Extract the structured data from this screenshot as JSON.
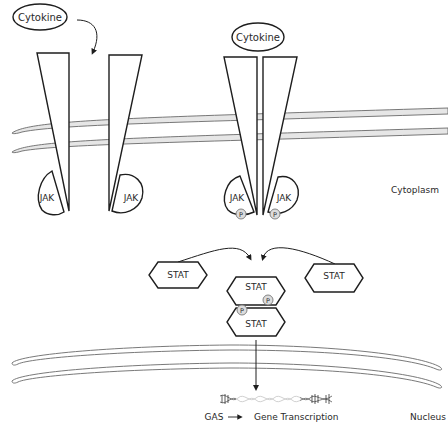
{
  "diagram": {
    "colors": {
      "outline": "#1e1e1e",
      "membrane_fill": "#e6e6e6",
      "membrane_stroke": "#6a6a6a",
      "phospho_fill": "#dcdcdc",
      "text": "#2a2a2a"
    },
    "ligands": [
      {
        "label": "Cytokine",
        "state": "unbound"
      },
      {
        "label": "Cytokine",
        "state": "bound"
      }
    ],
    "receptors": {
      "inactive": {
        "kinases": [
          "JAK",
          "JAK"
        ]
      },
      "active": {
        "kinases": [
          "JAK",
          "JAK"
        ],
        "phospho": [
          "P",
          "P"
        ]
      }
    },
    "stats": {
      "left": "STAT",
      "right": "STAT",
      "dimer_top": "STAT",
      "dimer_bottom": "STAT",
      "phospho": [
        "P",
        "P"
      ]
    },
    "regions": {
      "cytoplasm": "Cytoplasm",
      "nucleus": "Nucleus"
    },
    "transcription": {
      "element": "GAS",
      "arrow": "→",
      "outcome": "Gene Transcription"
    }
  }
}
